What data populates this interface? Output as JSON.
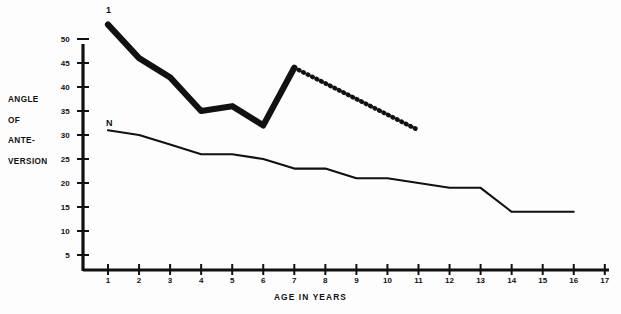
{
  "chart_data": {
    "type": "line",
    "title": "",
    "xlabel": "AGE IN YEARS",
    "ylabel_lines": [
      "ANGLE",
      "OF",
      "ANTE-",
      "VERSION"
    ],
    "ylabel": "ANGLE OF ANTE-VERSION",
    "grid": false,
    "legend_position": "inline-start-of-curve",
    "xlim": [
      0,
      17
    ],
    "ylim": [
      0,
      52
    ],
    "x_ticks": [
      1,
      2,
      3,
      4,
      5,
      6,
      7,
      8,
      9,
      10,
      11,
      12,
      13,
      14,
      15,
      16,
      17
    ],
    "x_tick_labels": [
      "1",
      "2",
      "3",
      "4",
      "5",
      "6",
      "7",
      "8",
      "9",
      "10",
      "11",
      "12",
      "13",
      "14",
      "15",
      "16",
      "17"
    ],
    "y_ticks": [
      5,
      10,
      15,
      20,
      25,
      30,
      35,
      40,
      45,
      50
    ],
    "y_tick_labels": [
      "5",
      "10",
      "15",
      "20",
      "25",
      "30",
      "35",
      "40",
      "45",
      "50"
    ],
    "series": [
      {
        "name": "1",
        "label": "1",
        "style": "thick-solid",
        "color": "#111111",
        "x": [
          1,
          2,
          3,
          4,
          5,
          6,
          7
        ],
        "values": [
          53,
          46,
          42,
          35,
          36,
          32,
          44
        ]
      },
      {
        "name": "1-projected",
        "label": "",
        "style": "dotted",
        "color": "#111111",
        "x": [
          7,
          11
        ],
        "values": [
          44,
          31
        ]
      },
      {
        "name": "N",
        "label": "N",
        "style": "thin-solid",
        "color": "#111111",
        "x": [
          1,
          2,
          3,
          4,
          5,
          6,
          7,
          8,
          9,
          10,
          11,
          12,
          13,
          14,
          15,
          16
        ],
        "values": [
          31,
          30,
          28,
          26,
          26,
          25,
          23,
          23,
          21,
          21,
          20,
          19,
          19,
          14,
          14,
          14
        ]
      }
    ]
  },
  "axes": {
    "y_title": {
      "l1": "ANGLE",
      "l2": "OF",
      "l3": "ANTE-",
      "l4": "VERSION"
    },
    "x_title": "AGE IN YEARS"
  }
}
